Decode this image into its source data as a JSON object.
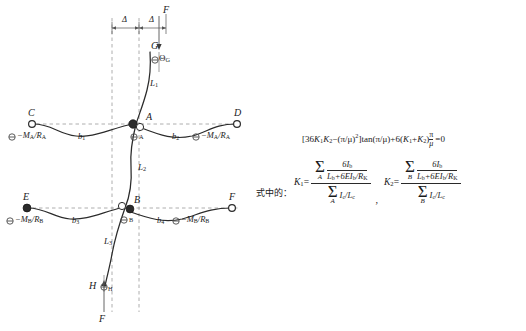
{
  "figure": {
    "colors": {
      "curve": "#2b2b2b",
      "dashed_guide": "#8a8a8a",
      "axis_dashed": "#9a9a9a",
      "node_fill": "#2b2b2b",
      "node_open": "#ffffff",
      "text": "#1a1a1a"
    },
    "points": {
      "A": "A",
      "B": "B",
      "C": "C",
      "D": "D",
      "E": "E",
      "F_top": "F",
      "F_right": "F",
      "F_bottom": "F",
      "G": "G",
      "H": "H"
    },
    "rotations": {
      "theta_A": "Θ",
      "theta_A_sub": "A",
      "theta_B_sub": "B",
      "theta_G_sub": "G",
      "theta_H_sub": "H"
    },
    "end_rotation_labels": {
      "C": "Θ",
      "C_expr": "−M",
      "A_sub": "A",
      "B_sub": "B",
      "R_A": "R",
      "R_B": "R"
    },
    "beam_labels": {
      "b1": "b",
      "b1_sub": "1",
      "b2": "b",
      "b2_sub": "2",
      "b3": "b",
      "b3_sub": "3",
      "b4": "b",
      "b4_sub": "4"
    },
    "column_labels": {
      "L1": "L",
      "L1_sub": "1",
      "L2": "L",
      "L2_sub": "2",
      "L3": "L",
      "L3_sub": "3"
    },
    "dimension_labels": {
      "delta_left": "Δ",
      "delta_right": "Δ"
    },
    "text_labels": {
      "C_full": "ΘA−MA/RA",
      "D_full": "ΘA−MA/RA",
      "E_full": "ΘB−MB/RB",
      "F_full": "ΘB−MB/RB"
    }
  },
  "equations": {
    "shizhong_label": "式中的：",
    "main": {
      "full_text": "[36K1K2−(π/μ)2]tan(π/μ)+6(K1+K2)π/μ =0",
      "open_bracket": "[",
      "coef36": "36",
      "K": "K",
      "K1_sub": "1",
      "K2_sub": "2",
      "minus": "−",
      "pi_over_mu": "(π/μ)",
      "squared": "2",
      "close_bracket": "]",
      "tan": "tan(π/μ)",
      "plus": "+",
      "coef6": "6(",
      "plus_inner": "+",
      "close_paren": ")",
      "pi": "π",
      "mu": "μ",
      "equals_zero": "=0"
    },
    "K1": {
      "name": "K",
      "sub": "1",
      "eq": "=",
      "sum_limit": "A",
      "numerator_term_num": "6I",
      "numerator_term_num_sub": "b",
      "numerator_term_den": "L",
      "numerator_term_den_sub": "b",
      "numerator_term_den_plus": "+6EI",
      "numerator_term_den_sub2": "b",
      "numerator_term_den_over": "/R",
      "numerator_term_den_sub3": "K",
      "denominator_term": "I",
      "denominator_term_sub": "c",
      "denominator_term_over": "/L",
      "denominator_term_sub2": "c",
      "separator": ","
    },
    "K2": {
      "name": "K",
      "sub": "2",
      "eq": "=",
      "sum_limit": "B",
      "numerator_term_num": "6I",
      "numerator_term_num_sub": "b",
      "numerator_term_den": "L",
      "numerator_term_den_sub": "b",
      "numerator_term_den_plus": "+6EI",
      "numerator_term_den_sub2": "b",
      "numerator_term_den_over": "/R",
      "numerator_term_den_sub3": "K",
      "denominator_term": "I",
      "denominator_term_sub": "c",
      "denominator_term_over": "/L",
      "denominator_term_sub2": "c"
    },
    "sigma_glyph": "Σ"
  }
}
